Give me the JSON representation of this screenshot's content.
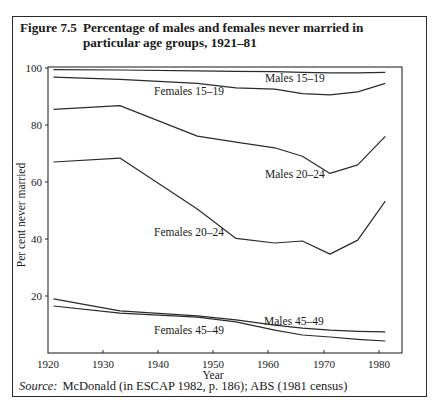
{
  "figure": {
    "number": "Figure 7.5",
    "title": "Percentage of males and females never married in particular age groups, 1921–81",
    "source_label": "Source:",
    "source_text": "McDonald (in ESCAP 1982, p. 186); ABS (1981 census)"
  },
  "chart_data": {
    "type": "line",
    "title": "Percentage of males and females never married in particular age groups, 1921–81",
    "xlabel": "Year",
    "ylabel": "Per cent never married",
    "xlim": [
      1920,
      1984
    ],
    "ylim": [
      0,
      100
    ],
    "x_ticks": [
      1920,
      1930,
      1940,
      1950,
      1960,
      1970,
      1980
    ],
    "y_ticks": [
      20,
      40,
      60,
      80,
      100
    ],
    "grid": false,
    "legend": "inline labels",
    "series": [
      {
        "name": "Males 15–19",
        "x": [
          1921,
          1933,
          1947,
          1954,
          1961,
          1966,
          1971,
          1976,
          1981
        ],
        "values": [
          99.4,
          99.3,
          99.0,
          98.8,
          98.7,
          98.5,
          98.3,
          98.3,
          98.5
        ]
      },
      {
        "name": "Females 15–19",
        "x": [
          1921,
          1933,
          1947,
          1954,
          1961,
          1966,
          1971,
          1976,
          1981
        ],
        "values": [
          96.8,
          96.0,
          94.6,
          93.0,
          92.6,
          91.0,
          90.6,
          91.6,
          94.6
        ]
      },
      {
        "name": "Males 20–24",
        "x": [
          1921,
          1933,
          1947,
          1954,
          1961,
          1966,
          1971,
          1976,
          1981
        ],
        "values": [
          85.5,
          86.8,
          76.1,
          74.0,
          72.0,
          69.0,
          63.0,
          66.0,
          76.0
        ]
      },
      {
        "name": "Females 20–24",
        "x": [
          1921,
          1933,
          1947,
          1954,
          1961,
          1966,
          1971,
          1976,
          1981
        ],
        "values": [
          67.0,
          68.4,
          50.5,
          40.2,
          38.6,
          39.3,
          34.7,
          39.6,
          53.3
        ]
      },
      {
        "name": "Males 45–49",
        "x": [
          1921,
          1933,
          1947,
          1954,
          1961,
          1966,
          1971,
          1976,
          1981
        ],
        "values": [
          19.0,
          14.8,
          13.0,
          11.6,
          9.8,
          8.7,
          8.0,
          7.6,
          7.4
        ]
      },
      {
        "name": "Females 45–49",
        "x": [
          1921,
          1933,
          1947,
          1954,
          1961,
          1966,
          1971,
          1976,
          1981
        ],
        "values": [
          16.5,
          14.0,
          12.6,
          10.9,
          8.0,
          6.3,
          5.6,
          4.8,
          4.2
        ]
      }
    ]
  },
  "labels": {
    "males_15_19": "Males 15–19",
    "females_15_19": "Females 15–19",
    "males_20_24": "Males 20–24",
    "females_20_24": "Females 20–24",
    "males_45_49": "Males 45–49",
    "females_45_49": "Females 45–49",
    "x_ticks": [
      "1920",
      "1930",
      "1940",
      "1950",
      "1960",
      "1970",
      "1980"
    ],
    "y_ticks": [
      "20",
      "40",
      "60",
      "80",
      "100"
    ],
    "xlabel": "Year",
    "ylabel": "Per cent never married"
  }
}
